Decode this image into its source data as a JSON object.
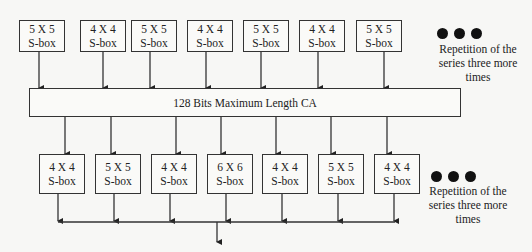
{
  "top_row": {
    "boxes": [
      {
        "size": "5 X 5",
        "label": "S-box"
      },
      {
        "size": "4 X 4",
        "label": "S-box"
      },
      {
        "size": "5 X 5",
        "label": "S-box"
      },
      {
        "size": "4 X 4",
        "label": "S-box"
      },
      {
        "size": "5 X 5",
        "label": "S-box"
      },
      {
        "size": "4 X 4",
        "label": "S-box"
      },
      {
        "size": "5 X 5",
        "label": "S-box"
      }
    ],
    "note": {
      "line1": "Repetition of the",
      "line2": "series three more",
      "line3": "times"
    }
  },
  "ca": {
    "label": "128 Bits Maximum Length CA"
  },
  "bottom_row": {
    "boxes": [
      {
        "size": "4 X 4",
        "label": "S-box"
      },
      {
        "size": "5 X 5",
        "label": "S-box"
      },
      {
        "size": "4 X 4",
        "label": "S-box"
      },
      {
        "size": "6 X 6",
        "label": "S-box"
      },
      {
        "size": "4 X 4",
        "label": "S-box"
      },
      {
        "size": "5 X 5",
        "label": "S-box"
      },
      {
        "size": "4 X 4",
        "label": "S-box"
      }
    ],
    "note": {
      "line1": "Repetition of the",
      "line2": "series three more",
      "line3": "times"
    }
  }
}
